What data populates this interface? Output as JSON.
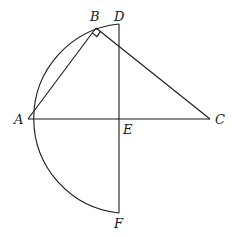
{
  "diagram": {
    "points": {
      "A": {
        "label": "A",
        "x": 28,
        "y": 119
      },
      "B": {
        "label": "B",
        "x": 96,
        "y": 28
      },
      "C": {
        "label": "C",
        "x": 210,
        "y": 119
      },
      "D": {
        "label": "D",
        "x": 119,
        "y": 24
      },
      "E": {
        "label": "E",
        "x": 119,
        "y": 119
      },
      "F": {
        "label": "F",
        "x": 119,
        "y": 213
      }
    },
    "segments": [
      "AB",
      "BC",
      "AC",
      "DF"
    ],
    "arc": {
      "from": "D",
      "through": "A",
      "to": "F",
      "center": "E"
    },
    "right_angle_at": "B"
  }
}
